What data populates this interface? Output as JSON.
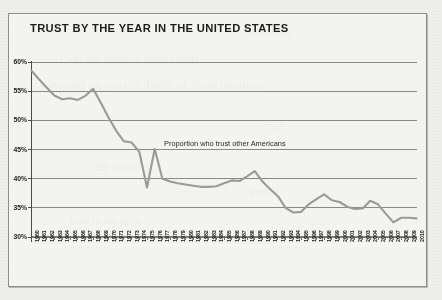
{
  "page": {
    "background_color": "#efefed",
    "frame_border_color": "#8e8e8a"
  },
  "title": "TRUST BY THE YEAR IN THE UNITED STATES",
  "annotation": "Proportion who trust other Americans",
  "ghost_text": [
    "and the best",
    "I was the wages of these people",
    "Law and on trust in Table of Trust mention",
    "trust",
    "the social",
    "trust of",
    "trust in the same"
  ],
  "chart_data": {
    "type": "line",
    "title": "TRUST BY THE YEAR IN THE UNITED STATES",
    "xlabel": "",
    "ylabel": "",
    "ylim": [
      30,
      60
    ],
    "yticks": [
      30,
      35,
      40,
      45,
      50,
      55,
      60
    ],
    "ytick_labels": [
      "30%",
      "35%",
      "40%",
      "45%",
      "50%",
      "55%",
      "60%"
    ],
    "grid": true,
    "grid_axis": "y",
    "legend": "none",
    "annotations": [
      {
        "text": "Proportion who trust other Americans",
        "x": 1978,
        "y": 45.5
      }
    ],
    "line_color": "#9a9a96",
    "series": [
      {
        "name": "Proportion who trust other Americans",
        "x": [
          1960,
          1961,
          1962,
          1963,
          1964,
          1965,
          1966,
          1967,
          1968,
          1969,
          1970,
          1971,
          1972,
          1973,
          1974,
          1975,
          1976,
          1977,
          1978,
          1979,
          1980,
          1981,
          1982,
          1983,
          1984,
          1985,
          1986,
          1987,
          1988,
          1989,
          1990,
          1991,
          1992,
          1993,
          1994,
          1995,
          1996,
          1997,
          1998,
          1999,
          2000,
          2001,
          2002,
          2003,
          2004,
          2005,
          2006,
          2007,
          2008,
          2009,
          2010
        ],
        "values": [
          58.5,
          57.0,
          55.6,
          54.2,
          53.6,
          53.8,
          53.5,
          54.2,
          55.4,
          53.0,
          50.5,
          48.2,
          46.4,
          46.2,
          44.6,
          38.5,
          45.1,
          40.0,
          39.5,
          39.2,
          39.0,
          38.8,
          38.6,
          38.6,
          38.7,
          39.2,
          39.7,
          39.6,
          40.4,
          41.3,
          39.5,
          38.2,
          37.0,
          35.0,
          34.2,
          34.3,
          35.6,
          36.5,
          37.3,
          36.3,
          36.0,
          35.2,
          34.8,
          34.9,
          36.2,
          35.6,
          34.0,
          32.5,
          33.3,
          33.3,
          33.2
        ]
      }
    ]
  },
  "axes": {
    "x_tick_labels": [
      "1960",
      "1961",
      "1962",
      "1963",
      "1964",
      "1965",
      "1966",
      "1967",
      "1968",
      "1969",
      "1970",
      "1971",
      "1972",
      "1973",
      "1974",
      "1975",
      "1976",
      "1977",
      "1978",
      "1979",
      "1980",
      "1981",
      "1982",
      "1983",
      "1984",
      "1985",
      "1986",
      "1987",
      "1988",
      "1989",
      "1990",
      "1991",
      "1992",
      "1993",
      "1994",
      "1995",
      "1996",
      "1997",
      "1998",
      "1999",
      "2000",
      "2001",
      "2002",
      "2003",
      "2004",
      "2005",
      "2006",
      "2007",
      "2008",
      "2009",
      "2010"
    ],
    "y_tick_labels": [
      "60%",
      "55%",
      "50%",
      "45%",
      "40%",
      "35%",
      "30%"
    ]
  }
}
